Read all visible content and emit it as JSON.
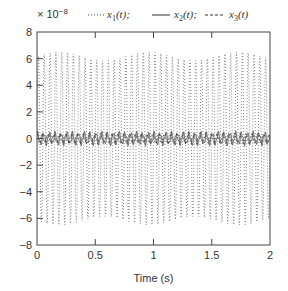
{
  "chart_data": {
    "type": "line",
    "title": "",
    "xlabel": "Time (s)",
    "ylabel": "",
    "y_scale_note": "× 10^-8",
    "xlim": [
      0,
      2
    ],
    "ylim": [
      -8,
      8
    ],
    "x_ticks": [
      "0",
      "0.5",
      "1",
      "1.5",
      "2"
    ],
    "y_ticks": [
      "8",
      "6",
      "4",
      "2",
      "0",
      "-2",
      "-4",
      "-6",
      "-8"
    ],
    "grid": false,
    "legend_position": "top",
    "series": [
      {
        "name": "x1(t)",
        "style": "dotted",
        "description": "oscillation ~20 Hz",
        "amplitude": 6.5,
        "frequency_hz": 20,
        "envelope": "slight beating between ~5.8 and ~6.8"
      },
      {
        "name": "x2(t)",
        "style": "solid",
        "description": "small oscillation around 0",
        "amplitude": 0.4,
        "frequency_hz": 20
      },
      {
        "name": "x3(t)",
        "style": "dashed",
        "description": "small oscillation around 0",
        "amplitude": 0.3,
        "frequency_hz": 20
      }
    ]
  },
  "labels": {
    "exponent_prefix": "× 10",
    "exponent_sup": "−8",
    "legend": [
      {
        "var": "x",
        "sub": "1",
        "arg": "(t);"
      },
      {
        "var": "x",
        "sub": "2",
        "arg": "(t);"
      },
      {
        "var": "x",
        "sub": "3",
        "arg": "(t)"
      }
    ],
    "xlabel": "Time (s)",
    "x_ticks": [
      "0",
      "0.5",
      "1",
      "1.5",
      "2"
    ],
    "y_ticks": [
      "8",
      "6",
      "4",
      "2",
      "0",
      "−2",
      "−4",
      "−6",
      "−8"
    ]
  }
}
